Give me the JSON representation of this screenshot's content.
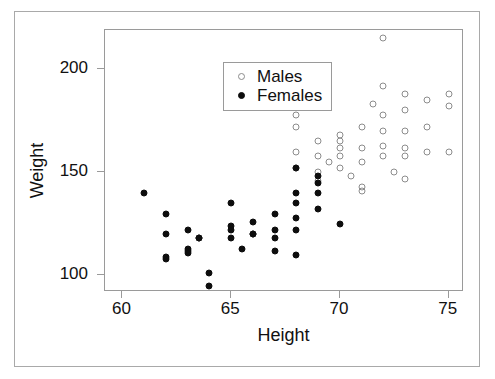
{
  "chart_data": {
    "type": "scatter",
    "title": "",
    "xlabel": "Height",
    "ylabel": "Weight",
    "xlim": [
      59.2,
      75.7
    ],
    "ylim": [
      92,
      219
    ],
    "xticks": [
      60,
      65,
      70,
      75
    ],
    "yticks": [
      100,
      150,
      200
    ],
    "grid": false,
    "legend_position": "top-left inside panel",
    "series": [
      {
        "name": "Males",
        "marker": "open-circle",
        "color": "#8c8c8c",
        "points": [
          [
            68,
            178
          ],
          [
            68,
            172
          ],
          [
            68,
            160
          ],
          [
            68,
            152
          ],
          [
            69,
            190
          ],
          [
            69,
            182
          ],
          [
            69,
            165
          ],
          [
            69,
            158
          ],
          [
            69,
            150
          ],
          [
            69,
            146
          ],
          [
            69.5,
            155
          ],
          [
            70,
            168
          ],
          [
            70,
            165
          ],
          [
            70,
            162
          ],
          [
            70,
            158
          ],
          [
            70,
            152
          ],
          [
            70.5,
            148
          ],
          [
            71,
            172
          ],
          [
            71,
            162
          ],
          [
            71,
            155
          ],
          [
            71,
            143
          ],
          [
            71,
            141
          ],
          [
            71.5,
            183
          ],
          [
            72,
            215
          ],
          [
            72,
            192
          ],
          [
            72,
            178
          ],
          [
            72,
            170
          ],
          [
            72,
            163
          ],
          [
            72,
            158
          ],
          [
            72.5,
            150
          ],
          [
            73,
            188
          ],
          [
            73,
            180
          ],
          [
            73,
            170
          ],
          [
            73,
            162
          ],
          [
            73,
            158
          ],
          [
            73,
            147
          ],
          [
            74,
            185
          ],
          [
            74,
            172
          ],
          [
            74,
            160
          ],
          [
            75,
            188
          ],
          [
            75,
            182
          ],
          [
            75,
            160
          ]
        ]
      },
      {
        "name": "Females",
        "marker": "filled-circle",
        "color": "#0d0d0d",
        "points": [
          [
            61,
            140
          ],
          [
            62,
            130
          ],
          [
            62,
            120
          ],
          [
            62,
            109
          ],
          [
            62,
            108
          ],
          [
            63,
            122
          ],
          [
            63,
            113
          ],
          [
            63,
            112
          ],
          [
            63,
            111
          ],
          [
            63.5,
            118
          ],
          [
            63.5,
            118
          ],
          [
            64,
            101
          ],
          [
            64,
            95
          ],
          [
            65,
            135
          ],
          [
            65,
            124
          ],
          [
            65,
            122
          ],
          [
            65,
            118
          ],
          [
            65.5,
            113
          ],
          [
            66,
            126
          ],
          [
            66,
            120
          ],
          [
            66,
            120
          ],
          [
            67,
            130
          ],
          [
            67,
            122
          ],
          [
            67,
            118
          ],
          [
            67,
            112
          ],
          [
            68,
            152
          ],
          [
            68,
            140
          ],
          [
            68,
            135
          ],
          [
            68,
            128
          ],
          [
            68,
            122
          ],
          [
            68,
            110
          ],
          [
            69,
            148
          ],
          [
            69,
            145
          ],
          [
            69,
            140
          ],
          [
            69,
            132
          ],
          [
            70,
            125
          ]
        ]
      }
    ]
  },
  "legend": {
    "entries": [
      {
        "label": "Males",
        "marker": "open-circle"
      },
      {
        "label": "Females",
        "marker": "filled-circle"
      }
    ]
  },
  "colors": {
    "female_marker": "#0d0d0d",
    "male_marker": "#8c8c8c",
    "axis_line": "#9a9a9a",
    "frame": "#a9a9a9",
    "background": "#ffffff",
    "text": "#111111"
  }
}
